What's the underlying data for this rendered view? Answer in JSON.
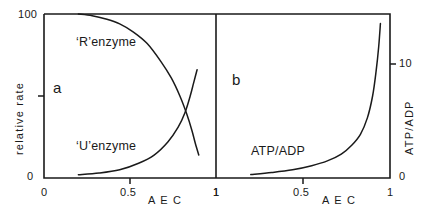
{
  "figure": {
    "background_color": "#ffffff",
    "line_color": "#1a1a1a",
    "panels": [
      {
        "id": "a",
        "letter": "a",
        "ylabel": "relative rate",
        "xlabel": "A E C",
        "xticks": [
          "0",
          "0.5",
          "1"
        ],
        "yticks": [
          "0",
          "100"
        ],
        "curve_labels": [
          "‘R’enzyme",
          "‘U’enzyme"
        ]
      },
      {
        "id": "b",
        "letter": "b",
        "ylabel": "ATP/ADP",
        "xlabel": "A E C",
        "xticks": [
          "1",
          "0.5",
          "1"
        ],
        "yticks": [
          "0",
          "10"
        ],
        "curve_labels": [
          "ATP/ADP"
        ]
      }
    ]
  },
  "chart_data": [
    {
      "type": "line",
      "panel": "a",
      "title": "",
      "xlabel": "A E C",
      "ylabel": "relative rate",
      "xlim": [
        0,
        1
      ],
      "ylim": [
        0,
        100
      ],
      "xticks": [
        0,
        0.5,
        1
      ],
      "xtick_labels": [
        "0",
        "0.5",
        "1"
      ],
      "yticks": [
        0,
        50,
        100
      ],
      "ytick_labels": [
        "0",
        "",
        "100"
      ],
      "grid": false,
      "legend": "inline-labels",
      "series": [
        {
          "name": "‘R’enzyme",
          "label_position": [
            0.27,
            78
          ],
          "x": [
            0.2,
            0.28,
            0.36,
            0.44,
            0.52,
            0.6,
            0.68,
            0.74,
            0.79,
            0.83,
            0.86,
            0.88,
            0.9
          ],
          "y": [
            100,
            99,
            97,
            94,
            89,
            82,
            71,
            61,
            50,
            39,
            29,
            21,
            14
          ]
        },
        {
          "name": "‘U’enzyme",
          "label_position": [
            0.27,
            24
          ],
          "x": [
            0.2,
            0.32,
            0.44,
            0.55,
            0.64,
            0.72,
            0.78,
            0.82,
            0.85,
            0.87,
            0.89
          ],
          "y": [
            2,
            3,
            5,
            9,
            14,
            22,
            31,
            40,
            50,
            58,
            66
          ]
        }
      ]
    },
    {
      "type": "line",
      "panel": "b",
      "title": "",
      "xlabel": "A E C",
      "ylabel": "ATP/ADP",
      "xlim": [
        0,
        1
      ],
      "ylim": [
        0,
        12
      ],
      "xticks": [
        0,
        0.5,
        1
      ],
      "xtick_labels": [
        "1",
        "0.5",
        "1"
      ],
      "yticks": [
        0,
        10
      ],
      "ytick_labels": [
        "0",
        "10"
      ],
      "grid": false,
      "legend": "inline-labels",
      "series": [
        {
          "name": "ATP/ADP",
          "label_position": [
            0.22,
            2.6
          ],
          "x": [
            0.2,
            0.32,
            0.44,
            0.55,
            0.64,
            0.72,
            0.78,
            0.83,
            0.87,
            0.9,
            0.92,
            0.935,
            0.945
          ],
          "y": [
            0.25,
            0.4,
            0.6,
            0.9,
            1.25,
            1.75,
            2.4,
            3.2,
            4.4,
            6.0,
            7.8,
            9.6,
            11.3
          ]
        }
      ]
    }
  ]
}
